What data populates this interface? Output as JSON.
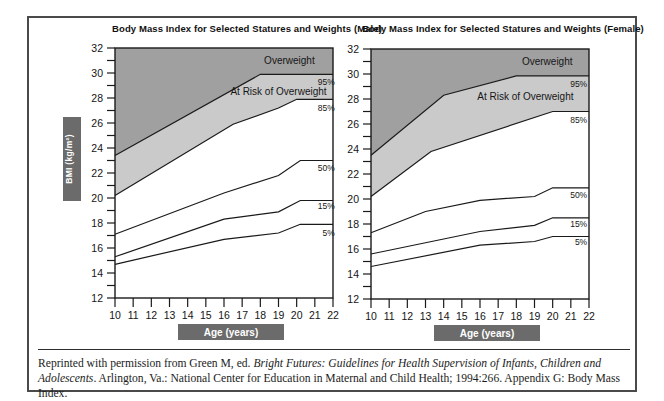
{
  "figure": {
    "citation": {
      "prefix": "Reprinted with permission from Green M, ed. ",
      "italic": "Bright Futures: Guidelines for Health Supervision of Infants, Children and Adolescents",
      "suffix": ". Arlington, Va.: National Center for Education in Maternal and Child Health; 1994:266. Appendix G: Body Mass Index."
    }
  },
  "colors": {
    "region_overweight": "#a0a0a0",
    "region_at_risk": "#cacaca",
    "axis_label_box": "#6b6b6b",
    "line": "#1a1a1a",
    "text": "#141414",
    "background": "#ffffff",
    "frame_border": "#4a4a4a"
  },
  "chart_data": [
    {
      "type": "area",
      "title": "Body Mass Index for Selected Statures and Weights (Male)",
      "xlabel": "Age (years)",
      "ylabel": "BMI (kg/m²)",
      "xlim": [
        10,
        22
      ],
      "ylim": [
        12,
        32
      ],
      "x_tick_step": 1,
      "y_tick_step": 1,
      "y_label_step": 2,
      "grid": false,
      "show_ylabel_box": true,
      "legend": "labels drawn at right edge of plot",
      "regions": [
        {
          "label": "Overweight",
          "upper": "top",
          "lower": "95%",
          "color": "#a0a0a0",
          "label_x": 19.6,
          "label_y": 31.0
        },
        {
          "label": "At Risk of Overweight",
          "upper": "95%",
          "lower": "85%",
          "color": "#cacaca",
          "label_x": 19.0,
          "label_y": 28.5
        }
      ],
      "series": [
        {
          "name": "95%",
          "points": [
            [
              10,
              23.4
            ],
            [
              18,
              29.9
            ],
            [
              22,
              29.9
            ]
          ],
          "label_x": 22.1,
          "label_y": 29.3
        },
        {
          "name": "85%",
          "points": [
            [
              10,
              20.2
            ],
            [
              16.5,
              25.9
            ],
            [
              19,
              27.2
            ],
            [
              20,
              27.9
            ],
            [
              22,
              27.9
            ]
          ],
          "label_x": 22.1,
          "label_y": 27.2
        },
        {
          "name": "50%",
          "points": [
            [
              10,
              17.1
            ],
            [
              16,
              20.4
            ],
            [
              19,
              21.8
            ],
            [
              20.2,
              23.0
            ],
            [
              22,
              23.0
            ]
          ],
          "label_x": 22.1,
          "label_y": 22.4
        },
        {
          "name": "15%",
          "points": [
            [
              10,
              15.3
            ],
            [
              16,
              18.3
            ],
            [
              19,
              18.9
            ],
            [
              20.2,
              19.8
            ],
            [
              22,
              19.8
            ]
          ],
          "label_x": 22.1,
          "label_y": 19.4
        },
        {
          "name": "5%",
          "points": [
            [
              10,
              14.7
            ],
            [
              16,
              16.7
            ],
            [
              19,
              17.2
            ],
            [
              20.2,
              17.9
            ],
            [
              22,
              17.9
            ]
          ],
          "label_x": 22.1,
          "label_y": 17.2
        }
      ]
    },
    {
      "type": "area",
      "title": "Body Mass Index for Selected Statures and Weights (Female)",
      "xlabel": "Age (years)",
      "ylabel": "BMI (kg/m²)",
      "xlim": [
        10,
        22
      ],
      "ylim": [
        12,
        32
      ],
      "x_tick_step": 1,
      "y_tick_step": 1,
      "y_label_step": 2,
      "grid": false,
      "show_ylabel_box": false,
      "legend": "labels drawn at right edge of plot",
      "regions": [
        {
          "label": "Overweight",
          "upper": "top",
          "lower": "95%",
          "color": "#a0a0a0",
          "label_x": 19.7,
          "label_y": 31.0
        },
        {
          "label": "At Risk of Overweight",
          "upper": "95%",
          "lower": "85%",
          "color": "#cacaca",
          "label_x": 18.5,
          "label_y": 28.2
        }
      ],
      "series": [
        {
          "name": "95%",
          "points": [
            [
              10,
              23.5
            ],
            [
              14,
              28.3
            ],
            [
              18,
              29.85
            ],
            [
              22,
              29.85
            ]
          ],
          "label_x": 21.9,
          "label_y": 29.2
        },
        {
          "name": "85%",
          "points": [
            [
              10,
              20.2
            ],
            [
              13.3,
              23.8
            ],
            [
              20,
              27.0
            ],
            [
              22,
              27.0
            ]
          ],
          "label_x": 21.9,
          "label_y": 26.3
        },
        {
          "name": "50%",
          "points": [
            [
              10,
              17.3
            ],
            [
              13,
              19.0
            ],
            [
              16,
              19.9
            ],
            [
              19,
              20.2
            ],
            [
              20,
              20.9
            ],
            [
              22,
              20.9
            ]
          ],
          "label_x": 21.9,
          "label_y": 20.3
        },
        {
          "name": "15%",
          "points": [
            [
              10,
              15.6
            ],
            [
              16,
              17.4
            ],
            [
              19,
              17.9
            ],
            [
              20,
              18.5
            ],
            [
              22,
              18.5
            ]
          ],
          "label_x": 21.9,
          "label_y": 18.0
        },
        {
          "name": "5%",
          "points": [
            [
              10,
              14.6
            ],
            [
              16,
              16.3
            ],
            [
              19,
              16.6
            ],
            [
              20,
              17.0
            ],
            [
              22,
              17.0
            ]
          ],
          "label_x": 21.9,
          "label_y": 16.6
        }
      ]
    }
  ]
}
